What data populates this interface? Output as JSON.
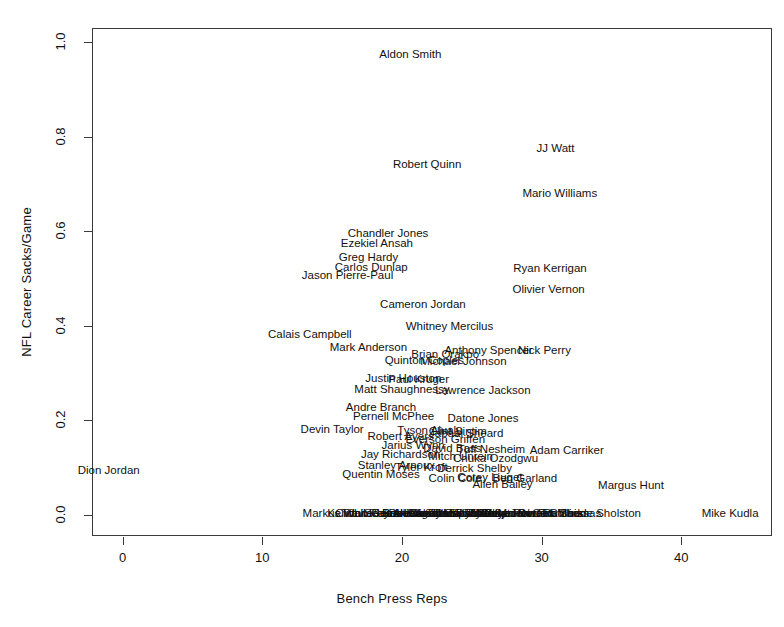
{
  "chart_data": {
    "type": "scatter",
    "title": "",
    "xlabel": "Bench Press Reps",
    "ylabel": "NFL Career Sacks/Game",
    "xlim": [
      -2.2,
      46.5
    ],
    "ylim": [
      -0.045,
      1.03
    ],
    "xticks": [
      0,
      10,
      20,
      30,
      40
    ],
    "yticks": [
      "0.0",
      "0.2",
      "0.4",
      "0.6",
      "0.8",
      "1.0"
    ],
    "ytick_values": [
      0.0,
      0.2,
      0.4,
      0.6,
      0.8,
      1.0
    ],
    "grid": false,
    "legend": "none",
    "marker_style": "text-labels",
    "note": "Each data point is drawn as the player's name centered at its (x, y) coordinate; dense overplotting in the lower middle region.",
    "points": [
      {
        "label": "Aldon Smith",
        "x": 20.6,
        "y": 0.975
      },
      {
        "label": "JJ Watt",
        "x": 31.0,
        "y": 0.777
      },
      {
        "label": "Robert Quinn",
        "x": 21.8,
        "y": 0.742
      },
      {
        "label": "Mario Williams",
        "x": 31.3,
        "y": 0.68
      },
      {
        "label": "Chandler Jones",
        "x": 19.0,
        "y": 0.596
      },
      {
        "label": "Ezekiel Ansah",
        "x": 18.2,
        "y": 0.575
      },
      {
        "label": "Greg Hardy",
        "x": 17.6,
        "y": 0.545
      },
      {
        "label": "Carlos Dunlap",
        "x": 17.8,
        "y": 0.524
      },
      {
        "label": "Ryan Kerrigan",
        "x": 30.6,
        "y": 0.522
      },
      {
        "label": "Jason Pierre-Paul",
        "x": 16.1,
        "y": 0.508
      },
      {
        "label": "Olivier Vernon",
        "x": 30.5,
        "y": 0.478
      },
      {
        "label": "Cameron Jordan",
        "x": 21.5,
        "y": 0.447
      },
      {
        "label": "Whitney Mercilus",
        "x": 23.4,
        "y": 0.399
      },
      {
        "label": "Calais Campbell",
        "x": 13.4,
        "y": 0.382
      },
      {
        "label": "Mark Anderson",
        "x": 17.6,
        "y": 0.354
      },
      {
        "label": "Anthony Spencer",
        "x": 26.2,
        "y": 0.348
      },
      {
        "label": "Nick Perry",
        "x": 30.2,
        "y": 0.348
      },
      {
        "label": "Brian Orakpo",
        "x": 23.1,
        "y": 0.34
      },
      {
        "label": "Quinton Coples",
        "x": 21.6,
        "y": 0.327
      },
      {
        "label": "Michael Johnson",
        "x": 24.4,
        "y": 0.325
      },
      {
        "label": "Justin Houston",
        "x": 20.1,
        "y": 0.29
      },
      {
        "label": "Paul Kruger",
        "x": 21.2,
        "y": 0.287
      },
      {
        "label": "Matt Shaughnessy",
        "x": 20.0,
        "y": 0.267
      },
      {
        "label": "Lawrence Jackson",
        "x": 25.8,
        "y": 0.264
      },
      {
        "label": "Andre Branch",
        "x": 18.5,
        "y": 0.228
      },
      {
        "label": "Pernell McPhee",
        "x": 19.4,
        "y": 0.208
      },
      {
        "label": "Datone Jones",
        "x": 25.8,
        "y": 0.205
      },
      {
        "label": "Devin Taylor",
        "x": 15.0,
        "y": 0.182
      },
      {
        "label": "Tyson Alualu",
        "x": 22.0,
        "y": 0.18
      },
      {
        "label": "Clint Sintim",
        "x": 24.0,
        "y": 0.178
      },
      {
        "label": "Jabaal Sheard",
        "x": 24.6,
        "y": 0.173
      },
      {
        "label": "Robert Ayers",
        "x": 19.9,
        "y": 0.166
      },
      {
        "label": "Everson Griffen",
        "x": 23.1,
        "y": 0.16
      },
      {
        "label": "Jarius Wynn",
        "x": 20.8,
        "y": 0.147
      },
      {
        "label": "David Bass",
        "x": 23.6,
        "y": 0.142
      },
      {
        "label": "Tuff Nesheim",
        "x": 26.4,
        "y": 0.14
      },
      {
        "label": "Adam Carriker",
        "x": 31.8,
        "y": 0.138
      },
      {
        "label": "Jay Richardson",
        "x": 19.9,
        "y": 0.128
      },
      {
        "label": "Mitch Unrein",
        "x": 24.2,
        "y": 0.124
      },
      {
        "label": "Chuka Ozodgwu",
        "x": 26.7,
        "y": 0.12
      },
      {
        "label": "Stanley Arnoux",
        "x": 19.6,
        "y": 0.105
      },
      {
        "label": "Tyler Kroft",
        "x": 21.4,
        "y": 0.102
      },
      {
        "label": "Derrick Shelby",
        "x": 25.2,
        "y": 0.098
      },
      {
        "label": "Quentin Moses",
        "x": 18.5,
        "y": 0.086
      },
      {
        "label": "Corey Liuget",
        "x": 26.3,
        "y": 0.08
      },
      {
        "label": "Colin Cole",
        "x": 23.8,
        "y": 0.078
      },
      {
        "label": "Ben Garland",
        "x": 28.8,
        "y": 0.077
      },
      {
        "label": "Allen Bailey",
        "x": 27.2,
        "y": 0.065
      },
      {
        "label": "Margus Hunt",
        "x": 36.4,
        "y": 0.062
      },
      {
        "label": "Dion Jordan",
        "x": -1.0,
        "y": 0.095
      },
      {
        "label": "Markus White",
        "x": 15.4,
        "y": 0.003
      },
      {
        "label": "Kendall Reyes",
        "x": 17.3,
        "y": 0.003
      },
      {
        "label": "Clifton Geathers",
        "x": 18.2,
        "y": 0.003
      },
      {
        "label": "Travian Robertson",
        "x": 19.0,
        "y": 0.003
      },
      {
        "label": "Sealver Siliga",
        "x": 19.8,
        "y": 0.003
      },
      {
        "label": "Jurrell Casey",
        "x": 20.4,
        "y": 0.003
      },
      {
        "label": "Devon Still",
        "x": 21.0,
        "y": 0.003
      },
      {
        "label": "Akiem Hicks",
        "x": 21.6,
        "y": 0.003
      },
      {
        "label": "Brandon Thompson",
        "x": 22.2,
        "y": 0.003
      },
      {
        "label": "Jared Crick",
        "x": 22.8,
        "y": 0.003
      },
      {
        "label": "Kheeston Randall",
        "x": 23.4,
        "y": 0.003
      },
      {
        "label": "Alameda Ta'amu",
        "x": 24.0,
        "y": 0.003
      },
      {
        "label": "Derek Wolfe",
        "x": 24.6,
        "y": 0.003
      },
      {
        "label": "Billy Winn",
        "x": 25.2,
        "y": 0.003
      },
      {
        "label": "Marcus Forston",
        "x": 25.8,
        "y": 0.003
      },
      {
        "label": "Josh Chapman",
        "x": 26.4,
        "y": 0.003
      },
      {
        "label": "Mike Martin",
        "x": 27.0,
        "y": 0.003
      },
      {
        "label": "Tydreke Powell",
        "x": 27.6,
        "y": 0.003
      },
      {
        "label": "Jaye Howard",
        "x": 28.4,
        "y": 0.003
      },
      {
        "label": "Ricky Jean Francois",
        "x": 29.2,
        "y": 0.003
      },
      {
        "label": "Sen Derrick Marks",
        "x": 30.0,
        "y": 0.003
      },
      {
        "label": "Nate Collins",
        "x": 30.8,
        "y": 0.003
      },
      {
        "label": "Cam Thomas",
        "x": 31.8,
        "y": 0.003
      },
      {
        "label": "Ra'Shede Sholston",
        "x": 33.6,
        "y": 0.003
      },
      {
        "label": "Mike Kudla",
        "x": 43.5,
        "y": 0.003
      }
    ]
  },
  "axes": {
    "x_title": "Bench Press Reps",
    "y_title": "NFL Career Sacks/Game",
    "x_tick_labels": [
      "0",
      "10",
      "20",
      "30",
      "40"
    ],
    "y_tick_labels": [
      "0.0",
      "0.2",
      "0.4",
      "0.6",
      "0.8",
      "1.0"
    ]
  },
  "style": {
    "frame_color": "#3a3a3a",
    "text_color": "#111111",
    "background": "#ffffff"
  }
}
